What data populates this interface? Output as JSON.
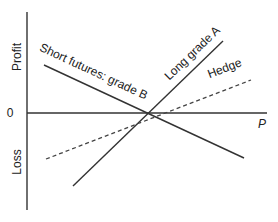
{
  "diagram": {
    "type": "payoff-diagram",
    "axes": {
      "y_upper_label": "Profit",
      "y_lower_label": "Loss",
      "origin_label": "0",
      "x_label": "P"
    },
    "lines": [
      {
        "id": "long-grade-a",
        "label": "Long grade A",
        "style": "solid"
      },
      {
        "id": "short-futures-grade-b",
        "label": "Short futures: grade B",
        "style": "solid"
      },
      {
        "id": "hedge",
        "label": "Hedge",
        "style": "dashed"
      }
    ],
    "colors": {
      "line": "#333333",
      "text": "#222222",
      "background": "#ffffff"
    }
  }
}
